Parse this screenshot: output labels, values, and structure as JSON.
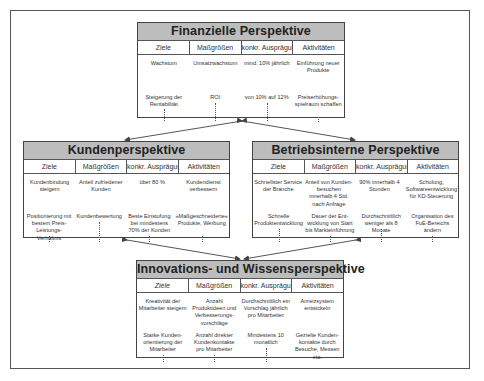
{
  "column_headers": [
    "Ziele",
    "Maßgrößen",
    "konkr. Ausprägung",
    "Aktivitäten"
  ],
  "perspectives": {
    "financial": {
      "title": "Finanzielle Perspektive",
      "rows": [
        [
          "Wachstum",
          "Umsatzwachstum",
          "mind. 10% jährlich",
          "Einführung neuer Produkte"
        ],
        [
          "Steigerung der Rentabilität",
          "ROI",
          "von 10% auf 12%",
          "Preiserhöhungs-spielraum schaffen"
        ]
      ]
    },
    "customer": {
      "title": "Kundenperspektive",
      "rows": [
        [
          "Kundenbindung steigern",
          "Anteil zufriedener Kunden",
          "über 80 %",
          "Kundendienst verbessern"
        ],
        [
          "Positionierung mit bestem Preis-Leistungs-Verhältnis",
          "Kundenbewertung",
          "Beste Einstufung bei mindestens 70% der Kunden",
          "»Maßgeschneiderte« Produkte, Werbung"
        ]
      ]
    },
    "internal": {
      "title": "Betriebsinterne Perspektive",
      "rows": [
        [
          "Schnellster Service der Branche",
          "Anteil von Kunden-besuchen innerhalb 4 Std. nach Anfrage",
          "90% innerhalb 4 Stunden",
          "Schulung, Softwareentwicklung für KD-Steuerung"
        ],
        [
          "Schnelle Produktentwicklung",
          "Dauer der Ent-wicklung von Start bis Markteinführung",
          "Durchschnittlich weniger als 8 Monate",
          "Organisation des FuE-Bereichs ändern"
        ]
      ]
    },
    "innovation": {
      "title": "Innovations- und Wissensperspektive",
      "rows": [
        [
          "Kreativität der Mitarbeiter steigern",
          "Anzahl Produktideen und Verbesserungs-vorschläge",
          "Durchschnittlich ein Vorschlag jährlich pro Mitarbeiter",
          "Anreizsystem entwickeln"
        ],
        [
          "Starke Kunden-orientierung der Mitarbeiter",
          "Anzahl direkter Kundenkontakte pro Mitarbeiter",
          "Mindestens 10 monatlich",
          "Gezielte Kunden-kontakte durch Besuche, Messen etc."
        ]
      ]
    }
  },
  "colors": {
    "header_fill": "#bdbdbd",
    "border": "#444444"
  }
}
